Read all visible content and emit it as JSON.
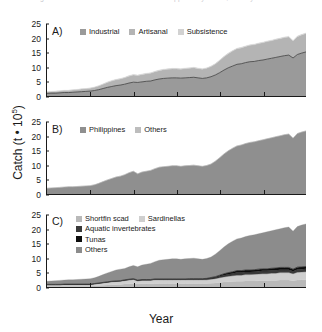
{
  "caption": {
    "text": "Fig. 1  Reconstructed total catch for the Philippines by sector, country and taxon"
  },
  "axes": {
    "ylabel_text": "Catch (t ",
    "ylabel_mid": "• 10",
    "ylabel_sup": "5",
    "ylabel_tail": ")",
    "xlabel": "Year",
    "yticks": [
      "0",
      "5",
      "10",
      "15",
      "20",
      "25"
    ],
    "xticks": [
      "1950",
      "1960",
      "1970",
      "1980",
      "1990",
      "2000",
      "2010"
    ]
  },
  "colors": {
    "industrial": "#9a9a9a",
    "artisanal": "#b4b4b4",
    "subsistence": "#d2d2d2",
    "philippines": "#8f8f8f",
    "others_b": "#bdbdbd",
    "shortfin_scad": "#b9b9b9",
    "sardinellas": "#cfcfcf",
    "aquatic_invertebrates": "#3a3a3a",
    "tunas": "#0d0d0d",
    "others_c": "#8c8c8c",
    "axis": "#1a1a1a",
    "background": "#ffffff"
  },
  "panels": {
    "a": {
      "label": "A)",
      "legend": [
        {
          "label": "Industrial",
          "color": "#9a9a9a"
        },
        {
          "label": "Artisanal",
          "color": "#b4b4b4"
        },
        {
          "label": "Subsistence",
          "color": "#d2d2d2"
        }
      ]
    },
    "b": {
      "label": "B)",
      "legend": [
        {
          "label": "Philippines",
          "color": "#8f8f8f"
        },
        {
          "label": "Others",
          "color": "#bdbdbd"
        }
      ]
    },
    "c": {
      "label": "C)",
      "legend": [
        {
          "label": "Shortfin scad",
          "color": "#b9b9b9"
        },
        {
          "label": "Sardinellas",
          "color": "#cfcfcf"
        },
        {
          "label": "Aquatic invertebrates",
          "color": "#3a3a3a"
        },
        {
          "label": "Tunas",
          "color": "#0d0d0d"
        },
        {
          "label": "Others",
          "color": "#8c8c8c"
        }
      ]
    }
  },
  "chart_data": {
    "type": "area",
    "xlabel": "Year",
    "ylabel": "Catch (t • 10^5)",
    "xlim": [
      1950,
      2010
    ],
    "ylim": [
      0,
      25
    ],
    "grid": false,
    "legend_position": "top-left inside each panel",
    "stacked": true,
    "x": [
      1950,
      1951,
      1952,
      1953,
      1954,
      1955,
      1956,
      1957,
      1958,
      1959,
      1960,
      1961,
      1962,
      1963,
      1964,
      1965,
      1966,
      1967,
      1968,
      1969,
      1970,
      1971,
      1972,
      1973,
      1974,
      1975,
      1976,
      1977,
      1978,
      1979,
      1980,
      1981,
      1982,
      1983,
      1984,
      1985,
      1986,
      1987,
      1988,
      1989,
      1990,
      1991,
      1992,
      1993,
      1994,
      1995,
      1996,
      1997,
      1998,
      1999,
      2000,
      2001,
      2002,
      2003,
      2004,
      2005,
      2006,
      2007,
      2008,
      2009,
      2010
    ],
    "panels": [
      {
        "id": "A",
        "label": "A)",
        "ylim": [
          0,
          25
        ],
        "series": [
          {
            "name": "Industrial",
            "color": "#9a9a9a",
            "values": [
              0.9,
              1.0,
              1.0,
              1.1,
              1.2,
              1.2,
              1.3,
              1.4,
              1.5,
              1.6,
              1.7,
              1.9,
              2.2,
              2.6,
              3.0,
              3.3,
              3.6,
              3.8,
              4.1,
              4.5,
              4.8,
              4.7,
              4.9,
              5.1,
              5.2,
              5.6,
              5.9,
              6.1,
              6.2,
              6.3,
              6.3,
              6.2,
              6.3,
              6.4,
              6.5,
              6.3,
              6.1,
              6.3,
              6.7,
              7.3,
              8.1,
              9.0,
              9.8,
              10.4,
              11.0,
              11.2,
              11.6,
              11.9,
              12.0,
              12.3,
              12.5,
              12.8,
              13.1,
              13.4,
              13.7,
              14.0,
              14.2,
              13.2,
              14.4,
              14.9,
              15.3
            ]
          },
          {
            "name": "Artisanal",
            "color": "#b4b4b4",
            "values": [
              0.5,
              0.5,
              0.6,
              0.6,
              0.7,
              0.7,
              0.8,
              0.8,
              0.9,
              0.9,
              1.0,
              1.1,
              1.3,
              1.5,
              1.7,
              1.9,
              2.0,
              2.1,
              2.2,
              2.4,
              2.5,
              2.4,
              2.5,
              2.6,
              2.7,
              2.8,
              2.9,
              3.0,
              3.1,
              3.1,
              3.1,
              3.1,
              3.2,
              3.2,
              3.3,
              3.2,
              3.2,
              3.3,
              3.5,
              3.8,
              4.2,
              4.6,
              4.9,
              5.2,
              5.4,
              5.5,
              5.6,
              5.7,
              5.8,
              5.9,
              6.0,
              6.1,
              6.1,
              6.2,
              6.2,
              6.3,
              6.3,
              5.9,
              6.2,
              6.3,
              6.4
            ]
          },
          {
            "name": "Subsistence",
            "color": "#d2d2d2",
            "values": [
              0.1,
              0.1,
              0.1,
              0.1,
              0.1,
              0.1,
              0.1,
              0.1,
              0.1,
              0.1,
              0.1,
              0.1,
              0.1,
              0.1,
              0.2,
              0.2,
              0.2,
              0.2,
              0.2,
              0.2,
              0.2,
              0.2,
              0.2,
              0.2,
              0.2,
              0.2,
              0.2,
              0.2,
              0.2,
              0.2,
              0.2,
              0.2,
              0.2,
              0.2,
              0.2,
              0.2,
              0.2,
              0.2,
              0.2,
              0.2,
              0.2,
              0.2,
              0.2,
              0.2,
              0.2,
              0.2,
              0.2,
              0.2,
              0.2,
              0.2,
              0.2,
              0.2,
              0.2,
              0.2,
              0.2,
              0.2,
              0.2,
              0.2,
              0.2,
              0.2,
              0.2
            ]
          }
        ]
      },
      {
        "id": "B",
        "label": "B)",
        "ylim": [
          0,
          25
        ],
        "series": [
          {
            "name": "Philippines",
            "color": "#8f8f8f",
            "values": [
              2.0,
              2.1,
              2.2,
              2.3,
              2.4,
              2.5,
              2.5,
              2.6,
              2.7,
              2.8,
              2.9,
              3.2,
              3.7,
              4.3,
              4.9,
              5.4,
              5.9,
              6.2,
              6.7,
              7.4,
              7.9,
              7.0,
              7.6,
              7.9,
              8.2,
              8.8,
              9.3,
              9.5,
              9.6,
              9.8,
              9.8,
              9.6,
              9.8,
              9.9,
              10.0,
              9.8,
              9.6,
              9.9,
              10.4,
              11.4,
              12.6,
              13.9,
              15.0,
              15.9,
              16.7,
              17.0,
              17.5,
              17.9,
              18.1,
              18.5,
              18.8,
              19.2,
              19.5,
              19.9,
              20.2,
              20.6,
              20.8,
              19.4,
              21.0,
              21.5,
              21.9
            ]
          },
          {
            "name": "Others",
            "color": "#bdbdbd",
            "values": [
              0.0,
              0.0,
              0.0,
              0.0,
              0.0,
              0.0,
              0.0,
              0.0,
              0.0,
              0.0,
              0.0,
              0.0,
              0.0,
              0.0,
              0.0,
              0.0,
              0.0,
              0.0,
              0.0,
              0.0,
              0.0,
              0.0,
              0.0,
              0.0,
              0.0,
              0.0,
              0.0,
              0.0,
              0.0,
              0.0,
              0.0,
              0.0,
              0.0,
              0.0,
              0.0,
              0.0,
              0.0,
              0.0,
              0.0,
              0.0,
              0.0,
              0.0,
              0.0,
              0.0,
              0.0,
              0.0,
              0.0,
              0.0,
              0.0,
              0.0,
              0.0,
              0.0,
              0.0,
              0.0,
              0.0,
              0.0,
              0.0,
              0.0,
              0.0,
              0.0,
              0.0
            ]
          }
        ]
      },
      {
        "id": "C",
        "label": "C)",
        "ylim": [
          0,
          25
        ],
        "series": [
          {
            "name": "Shortfin scad",
            "color": "#b9b9b9",
            "values": [
              0.3,
              0.3,
              0.3,
              0.3,
              0.3,
              0.3,
              0.3,
              0.3,
              0.3,
              0.3,
              0.3,
              0.4,
              0.5,
              0.6,
              0.7,
              0.8,
              0.8,
              0.9,
              1.0,
              1.1,
              1.2,
              1.0,
              1.1,
              1.1,
              1.1,
              1.2,
              1.2,
              1.2,
              1.2,
              1.2,
              1.2,
              1.2,
              1.2,
              1.2,
              1.2,
              1.2,
              1.2,
              1.2,
              1.3,
              1.4,
              1.6,
              1.7,
              1.8,
              1.9,
              2.0,
              2.0,
              2.1,
              2.1,
              2.1,
              2.2,
              2.2,
              2.2,
              2.3,
              2.3,
              2.4,
              2.4,
              2.4,
              2.2,
              2.4,
              2.5,
              2.5
            ]
          },
          {
            "name": "Sardinellas",
            "color": "#cfcfcf",
            "values": [
              0.4,
              0.4,
              0.4,
              0.4,
              0.5,
              0.5,
              0.5,
              0.5,
              0.5,
              0.5,
              0.5,
              0.6,
              0.7,
              0.8,
              0.9,
              1.0,
              1.1,
              1.1,
              1.2,
              1.3,
              1.4,
              1.1,
              1.2,
              1.2,
              1.2,
              1.3,
              1.3,
              1.3,
              1.3,
              1.3,
              1.3,
              1.3,
              1.3,
              1.3,
              1.3,
              1.3,
              1.3,
              1.3,
              1.4,
              1.5,
              1.6,
              1.8,
              1.9,
              2.0,
              2.1,
              2.1,
              2.2,
              2.2,
              2.3,
              2.3,
              2.4,
              2.4,
              2.5,
              2.5,
              2.6,
              2.6,
              2.6,
              2.4,
              2.7,
              2.7,
              2.8
            ]
          },
          {
            "name": "Aquatic invertebrates",
            "color": "#3a3a3a",
            "values": [
              0.1,
              0.1,
              0.1,
              0.1,
              0.1,
              0.1,
              0.1,
              0.1,
              0.1,
              0.1,
              0.1,
              0.1,
              0.1,
              0.1,
              0.1,
              0.1,
              0.1,
              0.1,
              0.2,
              0.2,
              0.2,
              0.2,
              0.2,
              0.2,
              0.2,
              0.2,
              0.2,
              0.2,
              0.2,
              0.2,
              0.2,
              0.2,
              0.2,
              0.2,
              0.2,
              0.2,
              0.2,
              0.3,
              0.3,
              0.4,
              0.5,
              0.6,
              0.7,
              0.8,
              0.9,
              0.9,
              0.9,
              0.9,
              0.9,
              1.0,
              1.0,
              1.0,
              1.0,
              1.0,
              1.0,
              1.0,
              1.0,
              0.9,
              1.0,
              1.0,
              1.0
            ]
          },
          {
            "name": "Tunas",
            "color": "#0d0d0d",
            "values": [
              0.1,
              0.1,
              0.1,
              0.1,
              0.1,
              0.1,
              0.1,
              0.1,
              0.1,
              0.1,
              0.1,
              0.1,
              0.1,
              0.1,
              0.1,
              0.1,
              0.1,
              0.1,
              0.1,
              0.1,
              0.1,
              0.1,
              0.1,
              0.1,
              0.1,
              0.1,
              0.1,
              0.1,
              0.1,
              0.1,
              0.1,
              0.1,
              0.1,
              0.2,
              0.2,
              0.2,
              0.2,
              0.2,
              0.3,
              0.3,
              0.4,
              0.5,
              0.6,
              0.6,
              0.7,
              0.7,
              0.7,
              0.7,
              0.7,
              0.7,
              0.7,
              0.7,
              0.7,
              0.8,
              0.8,
              0.8,
              0.8,
              0.7,
              0.8,
              0.8,
              0.8
            ]
          },
          {
            "name": "Others",
            "color": "#8c8c8c",
            "values": [
              1.1,
              1.2,
              1.3,
              1.4,
              1.4,
              1.5,
              1.5,
              1.6,
              1.7,
              1.8,
              1.9,
              2.0,
              2.3,
              2.7,
              3.1,
              3.4,
              3.8,
              4.0,
              3.9,
              4.3,
              4.6,
              4.6,
              5.0,
              5.3,
              5.6,
              6.0,
              6.5,
              6.7,
              6.8,
              7.0,
              7.0,
              6.8,
              7.0,
              7.0,
              7.1,
              6.9,
              6.7,
              6.9,
              7.1,
              7.8,
              8.5,
              9.3,
              10.0,
              10.6,
              11.0,
              11.3,
              11.6,
              12.0,
              12.1,
              12.3,
              12.5,
              12.9,
              13.0,
              13.3,
              13.4,
              13.8,
              14.0,
              13.2,
              14.1,
              14.5,
              14.8
            ]
          }
        ]
      }
    ]
  }
}
